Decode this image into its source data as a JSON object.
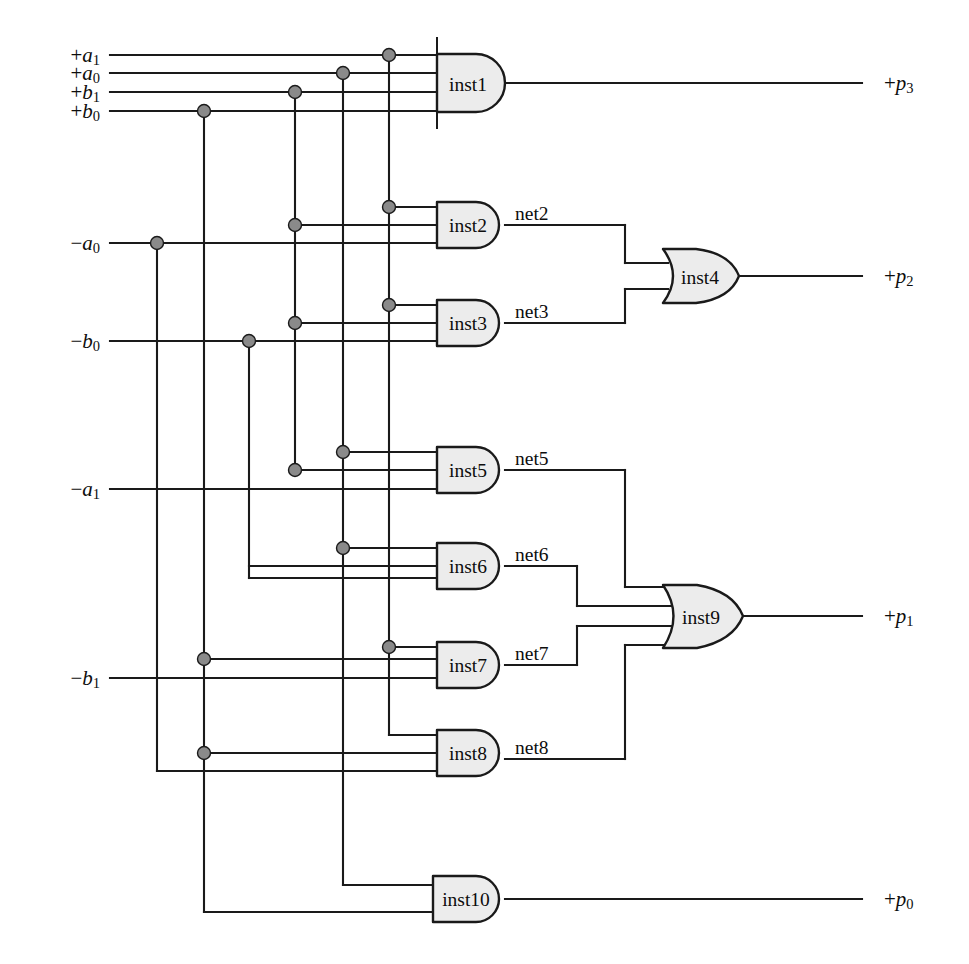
{
  "diagram": {
    "background_color": "#ffffff",
    "wire_color": "#1a1a1a",
    "gate_fill_color": "#ececec",
    "junction_color": "#8a8a8a"
  },
  "inputs": [
    {
      "id": "in_pa1",
      "sign": "+",
      "var": "a",
      "sub": "1",
      "label": "+a1",
      "y": 55
    },
    {
      "id": "in_pa0",
      "sign": "+",
      "var": "a",
      "sub": "0",
      "label": "+a0",
      "y": 73
    },
    {
      "id": "in_pb1",
      "sign": "+",
      "var": "b",
      "sub": "1",
      "label": "+b1",
      "y": 92
    },
    {
      "id": "in_pb0",
      "sign": "+",
      "var": "b",
      "sub": "0",
      "label": "+b0",
      "y": 111
    },
    {
      "id": "in_na0",
      "sign": "−",
      "var": "a",
      "sub": "0",
      "label": "-a0",
      "y": 243
    },
    {
      "id": "in_nb0",
      "sign": "−",
      "var": "b",
      "sub": "0",
      "label": "-b0",
      "y": 341
    },
    {
      "id": "in_na1",
      "sign": "−",
      "var": "a",
      "sub": "1",
      "label": "-a1",
      "y": 489
    },
    {
      "id": "in_nb1",
      "sign": "−",
      "var": "b",
      "sub": "1",
      "label": "-b1",
      "y": 678
    }
  ],
  "outputs": [
    {
      "id": "out_p3",
      "sign": "+",
      "var": "p",
      "sub": "3",
      "label": "+p3",
      "y": 83
    },
    {
      "id": "out_p2",
      "sign": "+",
      "var": "p",
      "sub": "2",
      "label": "+p2",
      "y": 276
    },
    {
      "id": "out_p1",
      "sign": "+",
      "var": "p",
      "sub": "1",
      "label": "+p1",
      "y": 616
    },
    {
      "id": "out_p0",
      "sign": "+",
      "var": "p",
      "sub": "0",
      "label": "+p0",
      "y": 899
    }
  ],
  "gates": [
    {
      "id": "inst1",
      "label": "inst1",
      "type": "and",
      "inputs": 4,
      "x": 437,
      "y": 83,
      "w": 68,
      "h": 58
    },
    {
      "id": "inst2",
      "label": "inst2",
      "type": "and",
      "inputs": 3,
      "x": 437,
      "y": 225,
      "w": 68,
      "h": 46
    },
    {
      "id": "inst3",
      "label": "inst3",
      "type": "and",
      "inputs": 3,
      "x": 437,
      "y": 323,
      "w": 68,
      "h": 46
    },
    {
      "id": "inst4",
      "label": "inst4",
      "type": "or",
      "inputs": 2,
      "x": 663,
      "y": 276,
      "w": 76,
      "h": 54
    },
    {
      "id": "inst5",
      "label": "inst5",
      "type": "and",
      "inputs": 3,
      "x": 437,
      "y": 470,
      "w": 68,
      "h": 46
    },
    {
      "id": "inst6",
      "label": "inst6",
      "type": "and",
      "inputs": 3,
      "x": 437,
      "y": 566,
      "w": 68,
      "h": 46
    },
    {
      "id": "inst7",
      "label": "inst7",
      "type": "and",
      "inputs": 3,
      "x": 437,
      "y": 665,
      "w": 68,
      "h": 46
    },
    {
      "id": "inst8",
      "label": "inst8",
      "type": "and",
      "inputs": 3,
      "x": 437,
      "y": 759,
      "w": 68,
      "h": 46
    },
    {
      "id": "inst9",
      "label": "inst9",
      "type": "or",
      "inputs": 4,
      "x": 663,
      "y": 616,
      "w": 80,
      "h": 60
    },
    {
      "id": "inst10",
      "label": "inst10",
      "type": "and",
      "inputs": 2,
      "x": 433,
      "y": 899,
      "w": 72,
      "h": 46
    }
  ],
  "nets": [
    {
      "id": "net2",
      "label": "net2",
      "x": 515,
      "y": 213,
      "from": "inst2",
      "to": "inst4"
    },
    {
      "id": "net3",
      "label": "net3",
      "x": 515,
      "y": 311,
      "from": "inst3",
      "to": "inst4"
    },
    {
      "id": "net5",
      "label": "net5",
      "x": 515,
      "y": 458,
      "from": "inst5",
      "to": "inst9"
    },
    {
      "id": "net6",
      "label": "net6",
      "x": 515,
      "y": 554,
      "from": "inst6",
      "to": "inst9"
    },
    {
      "id": "net7",
      "label": "net7",
      "x": 515,
      "y": 653,
      "from": "inst7",
      "to": "inst9"
    },
    {
      "id": "net8",
      "label": "net8",
      "x": 515,
      "y": 747,
      "from": "inst8",
      "to": "inst9"
    }
  ],
  "buses": [
    {
      "id": "bus_b0",
      "x": 204,
      "source": "+b0"
    },
    {
      "id": "bus_nb0",
      "x": 249,
      "source": "-b0"
    },
    {
      "id": "bus_b1",
      "x": 295,
      "source": "+b1"
    },
    {
      "id": "bus_a0",
      "x": 343,
      "source": "+a0"
    },
    {
      "id": "bus_a1",
      "x": 389,
      "source": "+a1"
    }
  ],
  "junctions": [
    {
      "id": "j_b0_bus",
      "x": 204,
      "y": 111
    },
    {
      "id": "j_b1_bus",
      "x": 295,
      "y": 92
    },
    {
      "id": "j_a0_bus",
      "x": 343,
      "y": 73
    },
    {
      "id": "j_a1_bus",
      "x": 389,
      "y": 55
    },
    {
      "id": "j_na0",
      "x": 157,
      "y": 243
    },
    {
      "id": "j_a1_i2",
      "x": 389,
      "y": 207
    },
    {
      "id": "j_b1_i2",
      "x": 295,
      "y": 225
    },
    {
      "id": "j_nb0",
      "x": 249,
      "y": 341
    },
    {
      "id": "j_a1_i3",
      "x": 389,
      "y": 305
    },
    {
      "id": "j_b1_i3",
      "x": 295,
      "y": 323
    },
    {
      "id": "j_a0_i5",
      "x": 343,
      "y": 452
    },
    {
      "id": "j_b1_i5",
      "x": 295,
      "y": 470
    },
    {
      "id": "j_a0_i6",
      "x": 343,
      "y": 548
    },
    {
      "id": "j_nb1_i7",
      "x": 204,
      "y": 659
    },
    {
      "id": "j_a1_i7",
      "x": 389,
      "y": 647
    },
    {
      "id": "j_nb1_i8",
      "x": 204,
      "y": 753
    }
  ],
  "net_count": 6,
  "gate_count": 10
}
